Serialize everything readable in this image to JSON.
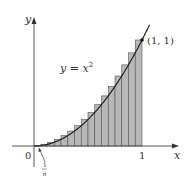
{
  "chart_data": {
    "type": "area",
    "title": "",
    "function": "y = x^2",
    "curve_label": "y = x²",
    "point_label": "(1, 1)",
    "point": [
      1,
      1
    ],
    "xlabel": "x",
    "ylabel": "y",
    "xlim": [
      0,
      1
    ],
    "ylim": [
      0,
      1
    ],
    "x_ticks": [
      {
        "value": 0,
        "label": "0"
      },
      {
        "value": 1,
        "label": "1"
      }
    ],
    "n_rectangles": 16,
    "rectangle_rule": "right endpoints (upper sum)",
    "annotation": {
      "label_num": "1",
      "label_den": "n",
      "points_to": "first subinterval width 1/n"
    },
    "grid": false,
    "rect_fill": "#b8b8b8",
    "rect_stroke": "#555555",
    "curve_color": "#222222"
  },
  "labels": {
    "y_axis": "y",
    "x_axis": "x",
    "origin": "0",
    "one": "1",
    "curve_lhs": "y = x",
    "curve_exp": "2",
    "point": "(1, 1)",
    "frac_num": "1",
    "frac_den": "n"
  }
}
